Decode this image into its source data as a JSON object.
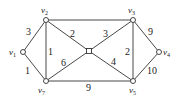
{
  "diagram": {
    "type": "weighted-undirected-graph",
    "colors": {
      "stroke": "#333333",
      "background": "#ffffff"
    },
    "nodes": [
      {
        "id": "v1",
        "label": "v",
        "sub": "1",
        "x": 23,
        "y": 52
      },
      {
        "id": "v2",
        "label": "v",
        "sub": "2",
        "x": 46,
        "y": 20
      },
      {
        "id": "v3",
        "label": "v",
        "sub": "3",
        "x": 133,
        "y": 20
      },
      {
        "id": "v4",
        "label": "v",
        "sub": "4",
        "x": 159,
        "y": 52
      },
      {
        "id": "v5",
        "label": "v",
        "sub": "5",
        "x": 133,
        "y": 81
      },
      {
        "id": "v7",
        "label": "v",
        "sub": "7",
        "x": 46,
        "y": 81
      },
      {
        "id": "c",
        "label": "",
        "sub": "",
        "x": 89,
        "y": 51
      }
    ],
    "edges": [
      {
        "from": "v1",
        "to": "v2",
        "weight": "3"
      },
      {
        "from": "v1",
        "to": "v7",
        "weight": "1"
      },
      {
        "from": "v2",
        "to": "v7",
        "weight": "1"
      },
      {
        "from": "v2",
        "to": "v3",
        "weight": ""
      },
      {
        "from": "v2",
        "to": "c",
        "weight": "2"
      },
      {
        "from": "v7",
        "to": "c",
        "weight": "6"
      },
      {
        "from": "v3",
        "to": "c",
        "weight": "3"
      },
      {
        "from": "c",
        "to": "v5",
        "weight": "4"
      },
      {
        "from": "v3",
        "to": "v5",
        "weight": "2"
      },
      {
        "from": "v3",
        "to": "v4",
        "weight": "9"
      },
      {
        "from": "v4",
        "to": "v5",
        "weight": "10"
      },
      {
        "from": "v7",
        "to": "v5",
        "weight": "9"
      }
    ]
  }
}
